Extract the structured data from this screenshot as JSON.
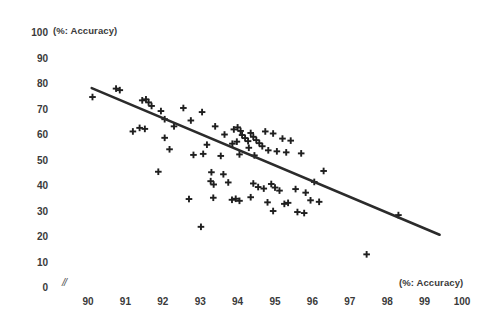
{
  "chart_data": {
    "type": "scatter",
    "title": "",
    "xlabel": "(%: Accuracy)",
    "ylabel": "(%: Accuracy)",
    "xlim": [
      90,
      100
    ],
    "ylim": [
      0,
      100
    ],
    "xticks": [
      90,
      91,
      92,
      93,
      94,
      95,
      96,
      97,
      98,
      99,
      100
    ],
    "yticks": [
      0,
      10,
      20,
      30,
      40,
      50,
      60,
      70,
      80,
      90,
      100
    ],
    "grid": false,
    "legend": null,
    "axis_break_symbol": "//",
    "marker": "plus",
    "marker_color": "#1f1f1f",
    "trendline": {
      "type": "linear",
      "color": "#2b2b2b",
      "width": 2.6,
      "x_start": 90.1,
      "y_start": 78.0,
      "x_end": 99.4,
      "y_end": 20.5
    },
    "points": [
      {
        "x": 90.12,
        "y": 74.5
      },
      {
        "x": 90.75,
        "y": 77.8
      },
      {
        "x": 90.85,
        "y": 77.2
      },
      {
        "x": 91.45,
        "y": 73.2
      },
      {
        "x": 91.55,
        "y": 73.6
      },
      {
        "x": 91.62,
        "y": 72.4
      },
      {
        "x": 91.7,
        "y": 71.0
      },
      {
        "x": 91.38,
        "y": 62.4
      },
      {
        "x": 91.52,
        "y": 62.0
      },
      {
        "x": 91.2,
        "y": 61.0
      },
      {
        "x": 91.95,
        "y": 69.0
      },
      {
        "x": 92.05,
        "y": 65.8
      },
      {
        "x": 92.55,
        "y": 70.2
      },
      {
        "x": 92.3,
        "y": 63.0
      },
      {
        "x": 92.75,
        "y": 65.3
      },
      {
        "x": 92.05,
        "y": 58.5
      },
      {
        "x": 92.18,
        "y": 54.0
      },
      {
        "x": 93.05,
        "y": 68.6
      },
      {
        "x": 93.4,
        "y": 63.0
      },
      {
        "x": 93.65,
        "y": 59.8
      },
      {
        "x": 93.18,
        "y": 55.8
      },
      {
        "x": 93.9,
        "y": 61.8
      },
      {
        "x": 94.0,
        "y": 62.6
      },
      {
        "x": 94.08,
        "y": 61.2
      },
      {
        "x": 94.12,
        "y": 59.6
      },
      {
        "x": 94.2,
        "y": 58.4
      },
      {
        "x": 94.28,
        "y": 57.2
      },
      {
        "x": 93.98,
        "y": 57.0
      },
      {
        "x": 93.86,
        "y": 56.2
      },
      {
        "x": 94.35,
        "y": 60.4
      },
      {
        "x": 94.42,
        "y": 58.9
      },
      {
        "x": 94.5,
        "y": 57.6
      },
      {
        "x": 94.58,
        "y": 56.4
      },
      {
        "x": 94.66,
        "y": 55.2
      },
      {
        "x": 94.3,
        "y": 54.6
      },
      {
        "x": 94.74,
        "y": 61.0
      },
      {
        "x": 94.95,
        "y": 60.2
      },
      {
        "x": 95.2,
        "y": 58.2
      },
      {
        "x": 95.42,
        "y": 57.4
      },
      {
        "x": 94.82,
        "y": 53.6
      },
      {
        "x": 95.05,
        "y": 53.2
      },
      {
        "x": 95.3,
        "y": 52.8
      },
      {
        "x": 94.05,
        "y": 52.0
      },
      {
        "x": 94.45,
        "y": 51.6
      },
      {
        "x": 93.55,
        "y": 51.4
      },
      {
        "x": 93.08,
        "y": 52.2
      },
      {
        "x": 92.82,
        "y": 51.8
      },
      {
        "x": 95.7,
        "y": 52.4
      },
      {
        "x": 93.3,
        "y": 45.0
      },
      {
        "x": 91.88,
        "y": 45.2
      },
      {
        "x": 93.62,
        "y": 44.2
      },
      {
        "x": 93.28,
        "y": 41.5
      },
      {
        "x": 93.36,
        "y": 40.2
      },
      {
        "x": 93.75,
        "y": 41.0
      },
      {
        "x": 94.42,
        "y": 40.6
      },
      {
        "x": 94.55,
        "y": 39.2
      },
      {
        "x": 94.7,
        "y": 38.6
      },
      {
        "x": 94.9,
        "y": 40.4
      },
      {
        "x": 95.0,
        "y": 39.0
      },
      {
        "x": 95.12,
        "y": 37.8
      },
      {
        "x": 95.55,
        "y": 38.4
      },
      {
        "x": 95.82,
        "y": 37.0
      },
      {
        "x": 96.3,
        "y": 45.5
      },
      {
        "x": 96.05,
        "y": 41.2
      },
      {
        "x": 92.7,
        "y": 34.5
      },
      {
        "x": 93.35,
        "y": 35.0
      },
      {
        "x": 93.85,
        "y": 34.2
      },
      {
        "x": 93.95,
        "y": 34.6
      },
      {
        "x": 94.05,
        "y": 33.8
      },
      {
        "x": 94.35,
        "y": 35.2
      },
      {
        "x": 94.8,
        "y": 33.2
      },
      {
        "x": 95.25,
        "y": 32.6
      },
      {
        "x": 95.35,
        "y": 33.0
      },
      {
        "x": 95.95,
        "y": 34.0
      },
      {
        "x": 96.18,
        "y": 33.4
      },
      {
        "x": 95.6,
        "y": 29.4
      },
      {
        "x": 95.78,
        "y": 29.0
      },
      {
        "x": 94.95,
        "y": 29.8
      },
      {
        "x": 93.02,
        "y": 23.6
      },
      {
        "x": 98.3,
        "y": 28.2
      },
      {
        "x": 97.45,
        "y": 12.8
      }
    ]
  }
}
